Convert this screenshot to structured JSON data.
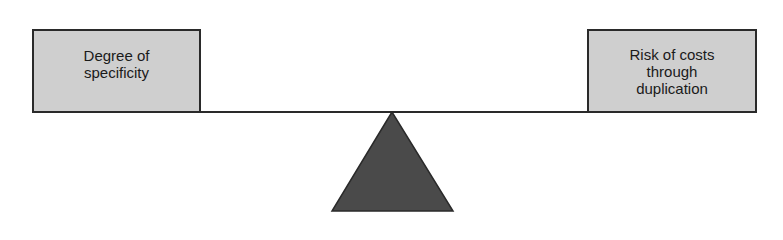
{
  "diagram": {
    "type": "balance-scale",
    "left_weight": {
      "label": "Degree of\nspecificity"
    },
    "right_weight": {
      "label": "Risk of costs\nthrough\nduplication"
    },
    "colors": {
      "box_fill": "#cfcfcf",
      "border": "#2a2a2a",
      "fulcrum": "#4a4a4a",
      "text": "#1a1a1a"
    }
  }
}
